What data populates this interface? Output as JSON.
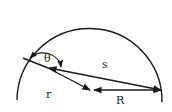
{
  "diagram": {
    "labels": {
      "theta": "θ",
      "s": "s",
      "r": "r",
      "R": "R"
    },
    "colors": {
      "stroke": "#1a1a1a",
      "background": "#ffffff"
    }
  }
}
